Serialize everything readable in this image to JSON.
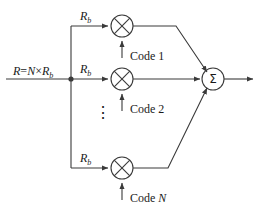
{
  "diagram": {
    "stroke_color": "#3a3a3a",
    "text_color": "#1a1a1a",
    "background": "#ffffff",
    "input": {
      "label_prefix": "R",
      "label_equals": "=",
      "label_n": "N",
      "label_times": "×",
      "label_rb": "R",
      "label_rb_sub": "b",
      "full_label": "R=N×Rb"
    },
    "branches": [
      {
        "rate_label": "R",
        "rate_sub": "b",
        "code_label": "Code 1",
        "multiplier_symbol": "⊗",
        "multiplier_name": "multiplier-1"
      },
      {
        "rate_label": "R",
        "rate_sub": "b",
        "code_label": "Code 2",
        "multiplier_symbol": "⊗",
        "multiplier_name": "multiplier-2"
      },
      {
        "rate_label": "R",
        "rate_sub": "b",
        "code_label": "Code N",
        "code_label_text": "Code ",
        "code_label_italic": "N",
        "multiplier_symbol": "⊗",
        "multiplier_name": "multiplier-n"
      }
    ],
    "ellipsis": "⋮",
    "summer": {
      "symbol": "Σ",
      "name": "summation-node"
    }
  }
}
